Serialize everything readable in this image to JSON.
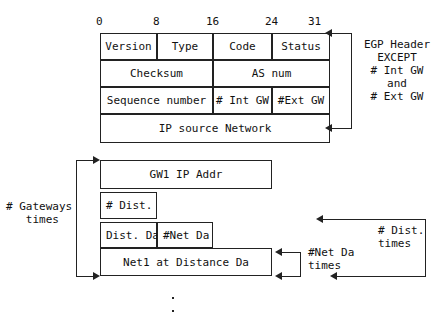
{
  "diagram": {
    "bit_scale": [
      {
        "label": "0",
        "x": 100
      },
      {
        "label": "8",
        "x": 157
      },
      {
        "label": "16",
        "x": 213
      },
      {
        "label": "24",
        "x": 272
      },
      {
        "label": "31",
        "x": 315
      }
    ],
    "rows": [
      {
        "name": "header-row-1",
        "fields": [
          {
            "label": "Version",
            "x": 100,
            "w": 57
          },
          {
            "label": "Type",
            "x": 157,
            "w": 56
          },
          {
            "label": "Code",
            "x": 213,
            "w": 59
          },
          {
            "label": "Status",
            "x": 272,
            "w": 58
          }
        ]
      },
      {
        "name": "header-row-2",
        "fields": [
          {
            "label": "Checksum",
            "x": 100,
            "w": 113
          },
          {
            "label": "AS  num",
            "x": 213,
            "w": 117
          }
        ]
      },
      {
        "name": "header-row-3",
        "fields": [
          {
            "label": "Sequence number",
            "x": 100,
            "w": 113
          },
          {
            "label": "# Int GW",
            "x": 213,
            "w": 59
          },
          {
            "label": "#Ext GW",
            "x": 272,
            "w": 58
          }
        ]
      },
      {
        "name": "ip-source-network-row",
        "fields": [
          {
            "label": "IP source Network",
            "x": 100,
            "w": 230
          }
        ]
      },
      {
        "name": "gateway-address-row",
        "fields": [
          {
            "label": "GW1 IP Addr",
            "x": 100,
            "w": 172
          }
        ]
      },
      {
        "name": "distance-count-row",
        "fields": [
          {
            "label": "# Dist.",
            "x": 100,
            "w": 57,
            "align": "left"
          }
        ]
      },
      {
        "name": "distance-data-row",
        "fields": [
          {
            "label": "Dist. Da",
            "x": 100,
            "w": 57,
            "align": "left"
          },
          {
            "label": "#Net Da",
            "x": 157,
            "w": 56,
            "align": "left"
          }
        ]
      },
      {
        "name": "network-distance-row",
        "fields": [
          {
            "label": "Net1 at Distance   Da",
            "x": 100,
            "w": 172
          }
        ]
      }
    ],
    "annotations": {
      "egp_header": "EGP Header\nEXCEPT\n# Int GW\nand\n# Ext GW",
      "gateways_times": "# Gateways\n   times",
      "net_da_times": "#Net Da\ntimes",
      "dist_times": "# Dist.\ntimes"
    },
    "continuation": "vertical-ellipsis",
    "colors": {
      "line": "#222222",
      "text": "#111111",
      "background": "#ffffff"
    }
  }
}
